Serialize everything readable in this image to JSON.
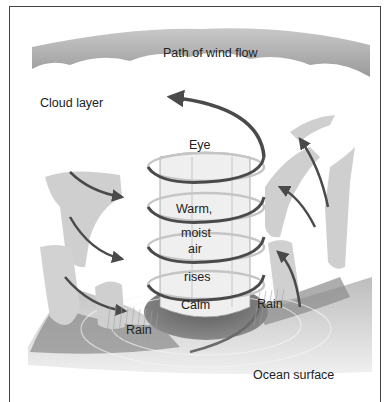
{
  "diagram": {
    "type": "hurricane cross-section illustration",
    "labels": {
      "path_of_wind_flow": "Path of wind flow",
      "cloud_layer": "Cloud layer",
      "eye": "Eye",
      "warm": "Warm,",
      "moist": "moist",
      "air": "air",
      "rises": "rises",
      "calm": "Calm",
      "rain_left": "Rain",
      "rain_right": "Rain",
      "ocean_surface": "Ocean surface"
    },
    "colors": {
      "sky_band": "#a9a9a9",
      "cloud": "#f2f2f2",
      "cloud_shadow": "#bdbdbd",
      "arrow": "#4a4a4a",
      "calm_area": "#6e6e6e",
      "ocean": "#d6d6d6",
      "border": "#444444"
    }
  }
}
